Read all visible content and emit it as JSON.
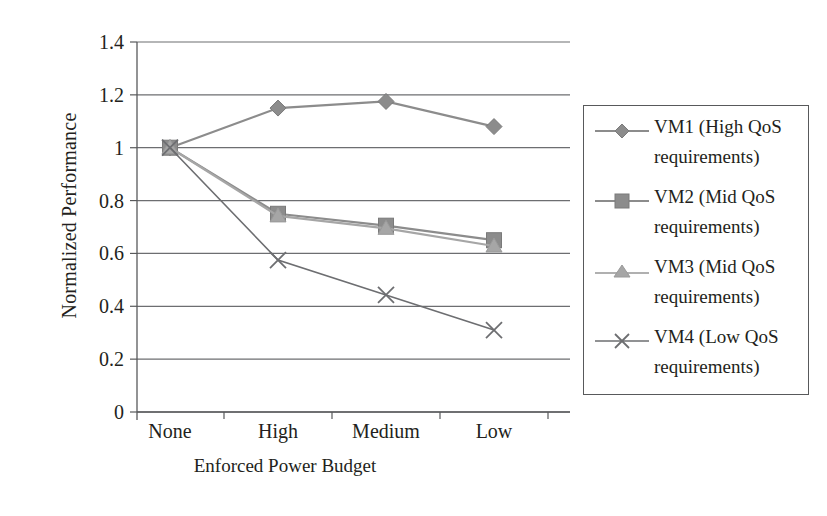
{
  "chart_data": {
    "type": "line",
    "title": "",
    "subtitle": "",
    "xlabel": "Enforced Power Budget",
    "ylabel": "Normalized Performance",
    "categories": [
      "None",
      "High",
      "Medium",
      "Low"
    ],
    "x": [
      0,
      1,
      2,
      3
    ],
    "ylim": [
      0,
      1.4
    ],
    "yticks": [
      "0",
      "0.2",
      "0.4",
      "0.6",
      "0.8",
      "1",
      "1.2",
      "1.4"
    ],
    "ytick_values": [
      0,
      0.2,
      0.4,
      0.6,
      0.8,
      1,
      1.2,
      1.4
    ],
    "grid": true,
    "grid_axis": "y",
    "legend_position": "right-outside",
    "series": [
      {
        "name": "VM1 (High QoS requirements)",
        "label_line1": "VM1 (High QoS",
        "label_line2": "requirements)",
        "marker": "diamond",
        "color": "#8c8c8c",
        "values": [
          1.0,
          1.15,
          1.175,
          1.08
        ]
      },
      {
        "name": "VM2 (Mid QoS requirements)",
        "label_line1": "VM2 (Mid QoS",
        "label_line2": "requirements)",
        "marker": "square",
        "color": "#8c8c8c",
        "values": [
          1.0,
          0.75,
          0.705,
          0.65
        ]
      },
      {
        "name": "VM3 (Mid QoS requirements)",
        "label_line1": "VM3 (Mid QoS",
        "label_line2": "requirements)",
        "marker": "triangle",
        "color": "#a6a6a6",
        "values": [
          1.0,
          0.742,
          0.695,
          0.628
        ]
      },
      {
        "name": "VM4 (Low QoS requirements)",
        "label_line1": "VM4 (Low QoS",
        "label_line2": "requirements)",
        "marker": "x",
        "color": "#6d6e71",
        "values": [
          1.0,
          0.575,
          0.443,
          0.31
        ]
      }
    ]
  },
  "axes": {
    "y_title": "Normalized Performance",
    "x_title": "Enforced Power Budget",
    "y_ticks": [
      "1.4",
      "1.2",
      "1",
      "0.8",
      "0.6",
      "0.4",
      "0.2",
      "0"
    ],
    "x_ticks": [
      "None",
      "High",
      "Medium",
      "Low"
    ]
  },
  "legend": {
    "entries": [
      {
        "line1": "VM1 (High QoS",
        "line2": "requirements)",
        "marker": "diamond"
      },
      {
        "line1": "VM2 (Mid QoS",
        "line2": "requirements)",
        "marker": "square"
      },
      {
        "line1": "VM3 (Mid QoS",
        "line2": "requirements)",
        "marker": "triangle"
      },
      {
        "line1": "VM4 (Low QoS",
        "line2": "requirements)",
        "marker": "x"
      }
    ]
  },
  "colors": {
    "axis": "#58595b",
    "grid": "#6d6e71",
    "vm1": "#8c8c8c",
    "vm2": "#8c8c8c",
    "vm3": "#a6a6a6",
    "vm4": "#6d6e71",
    "background": "#ffffff"
  }
}
